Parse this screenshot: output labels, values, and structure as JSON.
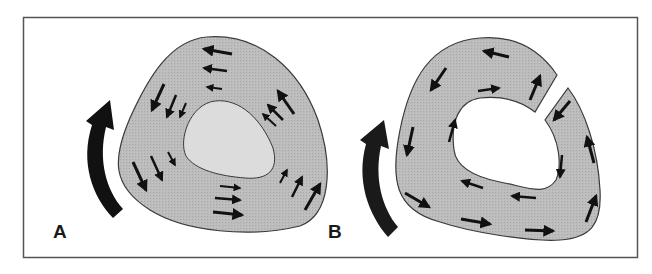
{
  "figure": {
    "panels": [
      {
        "id": "A",
        "label": "A",
        "description": "Closed ring of tissue around a light-gray central lumen, with small arrows indicating circular flow; large curved arrow at left pointing upward.",
        "ring_closed": true,
        "lumen_fill": "#dcdcdc"
      },
      {
        "id": "B",
        "label": "B",
        "description": "Ring of tissue broken by a gap at upper right, white central opening, small arrows indicating flow; large curved arrow at left pointing upward.",
        "ring_closed": false,
        "lumen_fill": "#ffffff"
      }
    ],
    "colors": {
      "background": "#ffffff",
      "frame": "#555555",
      "tissue_fill": "#b8b8b8",
      "outline": "#3a3a3a",
      "arrow": "#111111"
    }
  }
}
